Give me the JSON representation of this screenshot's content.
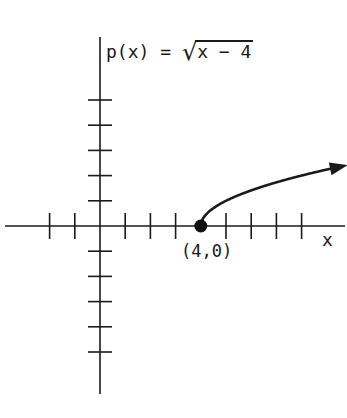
{
  "chart_data": {
    "type": "line",
    "function": {
      "name": "p(x)",
      "expression": "sqrt(x - 4)",
      "display_prefix": "p(x)",
      "display_equals": "=",
      "display_radicand": "x − 4"
    },
    "xlabel": "x",
    "ylabel": "",
    "grid": false,
    "legend": null,
    "axes": {
      "x_ticks_left_of_origin": [
        -2,
        -1
      ],
      "x_ticks_right_of_origin": [
        1,
        2,
        3,
        4,
        5,
        6,
        7,
        8
      ],
      "y_ticks_above_origin": [
        1,
        2,
        3,
        4,
        5
      ],
      "y_ticks_below_origin": [
        -1,
        -2,
        -3,
        -4,
        -5
      ],
      "tick_labels_shown": false,
      "xlim": [
        -3.8,
        9.8
      ],
      "ylim": [
        -6.7,
        7.6
      ]
    },
    "series": [
      {
        "name": "p(x) = sqrt(x - 4)",
        "x": [
          4,
          4.25,
          5,
          6,
          7,
          8,
          9.6
        ],
        "y": [
          0,
          0.5,
          1,
          1.41,
          1.73,
          2,
          2.37
        ],
        "start_point": {
          "x": 4,
          "y": 0,
          "closed": true
        },
        "continues_arrow": true
      }
    ],
    "annotations": [
      {
        "text": "(4,0)",
        "x": 4,
        "y": 0,
        "position": "below"
      }
    ]
  },
  "labels": {
    "func_prefix": "p(x)",
    "func_equals": " = ",
    "func_sqrt_symbol": "√",
    "func_radicand": "x − 4",
    "x_axis": "x",
    "point": "(4,0)"
  },
  "colors": {
    "ink": "#1a1a1a",
    "background": "#ffffff"
  }
}
